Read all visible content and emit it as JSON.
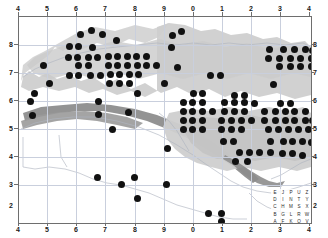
{
  "figure": {
    "kind": "utm-distribution-map",
    "background_color": "#ffffff",
    "frame_color": "#6e6e6e",
    "grid_color": "#c9cfdd",
    "dot_color": "#111111",
    "land_light_color": "#cfcfcf",
    "land_mid_color": "#b9b9b9",
    "land_dark_color": "#8d8d8d",
    "coast_color": "#b0b6c2"
  },
  "axes": {
    "top_labels": [
      "4",
      "5",
      "6",
      "7",
      "8",
      "9",
      "0",
      "1",
      "2",
      "3",
      "4"
    ],
    "bottom_labels": [
      "4",
      "5",
      "6",
      "7",
      "8",
      "9",
      "0",
      "1",
      "2",
      "3",
      "4"
    ],
    "left_labels": [
      "8",
      "7",
      "6",
      "5",
      "4",
      "3",
      "2"
    ],
    "right_labels": [
      "8",
      "7",
      "6",
      "5",
      "4",
      "3",
      "2"
    ]
  },
  "legend": {
    "name": "utm-100km-square-letter-key",
    "rows": [
      [
        "E",
        "J",
        "P",
        "U",
        "Z"
      ],
      [
        "D",
        "I",
        "N",
        "T",
        "Y"
      ],
      [
        "C",
        "H",
        "M",
        "S",
        "X"
      ],
      [
        "B",
        "G",
        "L",
        "R",
        "W"
      ],
      [
        "A",
        "F",
        "K",
        "Q",
        "V"
      ]
    ]
  },
  "chart_data": {
    "type": "scatter",
    "title": "",
    "xlabel": "",
    "ylabel": "",
    "xlim": [
      4,
      14
    ],
    "ylim": [
      2,
      8
    ],
    "xtick_labels": [
      "4",
      "5",
      "6",
      "7",
      "8",
      "9",
      "0",
      "1",
      "2",
      "3",
      "4"
    ],
    "ytick_labels": [
      "8",
      "7",
      "6",
      "5",
      "4",
      "3",
      "2"
    ],
    "grid": true,
    "legend_position": "bottom-right",
    "marker": "filled-circle",
    "note": "Occupied 10km UTM squares marked by filled dots over shaded relief.",
    "points": [
      [
        6.1,
        7.48
      ],
      [
        6.47,
        7.62
      ],
      [
        6.86,
        7.5
      ],
      [
        7.33,
        7.32
      ],
      [
        9.25,
        7.45
      ],
      [
        9.55,
        7.58
      ],
      [
        5.73,
        7.15
      ],
      [
        6.05,
        7.15
      ],
      [
        6.5,
        7.12
      ],
      [
        9.22,
        7.12
      ],
      [
        12.58,
        7.05
      ],
      [
        13.05,
        7.05
      ],
      [
        13.45,
        7.05
      ],
      [
        13.8,
        7.05
      ],
      [
        14.05,
        7.02
      ],
      [
        5.7,
        6.82
      ],
      [
        6.02,
        6.82
      ],
      [
        6.38,
        6.82
      ],
      [
        6.68,
        6.82
      ],
      [
        7.05,
        6.86
      ],
      [
        7.38,
        6.86
      ],
      [
        7.7,
        6.86
      ],
      [
        8.02,
        6.86
      ],
      [
        8.35,
        6.86
      ],
      [
        12.55,
        6.8
      ],
      [
        12.92,
        6.8
      ],
      [
        13.3,
        6.8
      ],
      [
        13.65,
        6.8
      ],
      [
        14.0,
        6.8
      ],
      [
        4.85,
        6.58
      ],
      [
        6.05,
        6.58
      ],
      [
        6.38,
        6.58
      ],
      [
        7.05,
        6.58
      ],
      [
        7.38,
        6.58
      ],
      [
        7.72,
        6.58
      ],
      [
        8.05,
        6.58
      ],
      [
        8.38,
        6.58
      ],
      [
        8.7,
        6.58
      ],
      [
        9.42,
        6.52
      ],
      [
        12.92,
        6.55
      ],
      [
        13.3,
        6.55
      ],
      [
        13.65,
        6.55
      ],
      [
        14.0,
        6.55
      ],
      [
        5.72,
        6.3
      ],
      [
        6.05,
        6.3
      ],
      [
        6.45,
        6.3
      ],
      [
        6.78,
        6.3
      ],
      [
        7.12,
        6.32
      ],
      [
        7.45,
        6.32
      ],
      [
        7.78,
        6.32
      ],
      [
        8.1,
        6.32
      ],
      [
        10.55,
        6.3
      ],
      [
        10.9,
        6.3
      ],
      [
        5.05,
        6.05
      ],
      [
        7.1,
        6.05
      ],
      [
        7.45,
        6.05
      ],
      [
        7.78,
        6.05
      ],
      [
        8.98,
        6.05
      ],
      [
        12.72,
        6.02
      ],
      [
        4.52,
        5.78
      ],
      [
        8.05,
        5.76
      ],
      [
        9.98,
        5.78
      ],
      [
        10.3,
        5.78
      ],
      [
        11.38,
        5.72
      ],
      [
        11.72,
        5.72
      ],
      [
        4.4,
        5.55
      ],
      [
        6.72,
        5.55
      ],
      [
        9.62,
        5.52
      ],
      [
        9.95,
        5.52
      ],
      [
        10.28,
        5.52
      ],
      [
        11.05,
        5.5
      ],
      [
        11.38,
        5.5
      ],
      [
        11.72,
        5.5
      ],
      [
        12.08,
        5.48
      ],
      [
        12.95,
        5.48
      ],
      [
        13.3,
        5.48
      ],
      [
        4.45,
        5.12
      ],
      [
        6.72,
        5.15
      ],
      [
        7.75,
        5.22
      ],
      [
        9.62,
        5.25
      ],
      [
        9.95,
        5.25
      ],
      [
        10.28,
        5.25
      ],
      [
        10.62,
        5.25
      ],
      [
        11.05,
        5.25
      ],
      [
        11.38,
        5.25
      ],
      [
        11.72,
        5.25
      ],
      [
        12.42,
        5.25
      ],
      [
        12.78,
        5.25
      ],
      [
        13.12,
        5.25
      ],
      [
        13.45,
        5.25
      ],
      [
        13.8,
        5.25
      ],
      [
        9.62,
        4.98
      ],
      [
        9.95,
        4.98
      ],
      [
        10.28,
        4.98
      ],
      [
        10.95,
        4.98
      ],
      [
        11.28,
        4.98
      ],
      [
        11.62,
        4.98
      ],
      [
        11.95,
        4.98
      ],
      [
        12.42,
        4.98
      ],
      [
        12.78,
        4.98
      ],
      [
        13.12,
        4.98
      ],
      [
        13.45,
        4.98
      ],
      [
        13.8,
        4.98
      ],
      [
        14.05,
        4.98
      ],
      [
        9.62,
        4.72
      ],
      [
        9.95,
        4.72
      ],
      [
        10.28,
        4.72
      ],
      [
        10.95,
        4.72
      ],
      [
        11.28,
        4.72
      ],
      [
        11.62,
        4.72
      ],
      [
        12.55,
        4.72
      ],
      [
        12.9,
        4.72
      ],
      [
        13.22,
        4.72
      ],
      [
        13.58,
        4.72
      ],
      [
        13.92,
        4.72
      ],
      [
        7.2,
        4.72
      ],
      [
        11.02,
        4.38
      ],
      [
        11.35,
        4.38
      ],
      [
        12.62,
        4.38
      ],
      [
        13.05,
        4.38
      ],
      [
        13.38,
        4.38
      ],
      [
        13.72,
        4.38
      ],
      [
        14.02,
        4.35
      ],
      [
        9.1,
        4.18
      ],
      [
        11.55,
        4.05
      ],
      [
        11.9,
        4.05
      ],
      [
        12.25,
        4.05
      ],
      [
        12.6,
        4.05
      ],
      [
        13.02,
        4.02
      ],
      [
        13.38,
        4.02
      ],
      [
        13.72,
        3.98
      ],
      [
        11.42,
        3.78
      ],
      [
        11.82,
        3.78
      ],
      [
        6.7,
        3.32
      ],
      [
        7.95,
        3.32
      ],
      [
        7.52,
        3.12
      ],
      [
        9.05,
        3.12
      ],
      [
        8.05,
        2.72
      ],
      [
        10.48,
        2.28
      ],
      [
        10.95,
        2.28
      ],
      [
        10.95,
        2.05
      ]
    ]
  }
}
